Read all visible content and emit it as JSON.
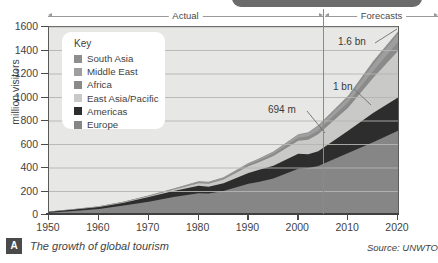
{
  "figure": {
    "badge_letter": "A",
    "caption": "The growth of global tourism",
    "source": "Source: UNWTO"
  },
  "spans": {
    "actual_label": "Actual",
    "forecast_label": "Forecasts"
  },
  "legend": {
    "title": "Key",
    "items": [
      {
        "label": "South Asia",
        "color": "#8e8e8e"
      },
      {
        "label": "Middle East",
        "color": "#9e9e9e"
      },
      {
        "label": "Africa",
        "color": "#8a8a8a"
      },
      {
        "label": "East Asia/Pacific",
        "color": "#c9c9c7"
      },
      {
        "label": "Americas",
        "color": "#2d2d2d"
      },
      {
        "label": "Europe",
        "color": "#868686"
      }
    ]
  },
  "annotations": {
    "peak": "1.6 bn",
    "mid": "1 bn",
    "current": "694 m"
  },
  "chart_data": {
    "type": "area",
    "title": "The growth of global tourism",
    "xlabel": "",
    "ylabel": "million visitors",
    "ylim": [
      0,
      1600
    ],
    "xlim": [
      1950,
      2020
    ],
    "ytick_labels": [
      "0",
      "200",
      "400",
      "600",
      "800",
      "1000",
      "1200",
      "1400",
      "1600"
    ],
    "yticks": [
      0,
      200,
      400,
      600,
      800,
      1000,
      1200,
      1400,
      1600
    ],
    "xtick_labels": [
      "1950",
      "1960",
      "1970",
      "1980",
      "1990",
      "2000",
      "2010",
      "2020"
    ],
    "xticks": [
      1950,
      1960,
      1970,
      1980,
      1990,
      2000,
      2010,
      2020
    ],
    "grid": true,
    "grid_axis": "y",
    "legend_position": "inside-top-left",
    "stacked": true,
    "forecast_divider_x": 2004,
    "x": [
      1950,
      1955,
      1960,
      1965,
      1970,
      1975,
      1980,
      1982,
      1985,
      1990,
      1992,
      1995,
      2000,
      2002,
      2004,
      2010,
      2015,
      2020
    ],
    "series": [
      {
        "name": "Europe",
        "color": "#868686",
        "values": [
          20,
          34,
          52,
          80,
          113,
          154,
          186,
          182,
          205,
          265,
          280,
          311,
          393,
          400,
          417,
          527,
          620,
          717
        ]
      },
      {
        "name": "Americas",
        "color": "#2d2d2d",
        "values": [
          8,
          13,
          17,
          24,
          41,
          50,
          62,
          59,
          65,
          93,
          102,
          109,
          128,
          117,
          126,
          190,
          248,
          282
        ]
      },
      {
        "name": "East Asia/Pacific",
        "color": "#c9c9c7",
        "values": [
          1,
          2,
          3,
          5,
          6,
          10,
          23,
          25,
          32,
          56,
          64,
          82,
          110,
          124,
          144,
          195,
          297,
          397
        ]
      },
      {
        "name": "Africa",
        "color": "#8a8a8a",
        "values": [
          1,
          1,
          1,
          2,
          3,
          5,
          7,
          8,
          9,
          15,
          17,
          20,
          27,
          29,
          33,
          47,
          61,
          77
        ]
      },
      {
        "name": "Middle East",
        "color": "#9e9e9e",
        "values": [
          0,
          1,
          1,
          2,
          3,
          5,
          7,
          7,
          8,
          10,
          11,
          14,
          24,
          28,
          36,
          36,
          51,
          69
        ]
      },
      {
        "name": "South Asia",
        "color": "#8e8e8e",
        "values": [
          0,
          0,
          1,
          1,
          1,
          2,
          2,
          2,
          3,
          4,
          4,
          4,
          6,
          6,
          8,
          19,
          31,
          19
        ]
      }
    ],
    "totals": [
      30,
      51,
      75,
      114,
      167,
      226,
      287,
      283,
      322,
      443,
      478,
      540,
      688,
      698,
      764,
      1014,
      1308,
      1561
    ],
    "data_labels": [
      {
        "text": "694 m",
        "x": 2004,
        "y": 694
      },
      {
        "text": "1 bn",
        "x": 2010,
        "y": 1000
      },
      {
        "text": "1.6 bn",
        "x": 2020,
        "y": 1600
      }
    ]
  }
}
